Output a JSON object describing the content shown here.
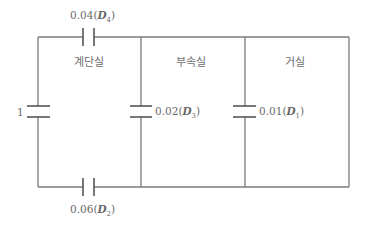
{
  "diagram": {
    "type": "equivalent-leakage-network",
    "rooms": [
      {
        "id": "stairwell",
        "label": "계단실"
      },
      {
        "id": "vestibule",
        "label": "부속실"
      },
      {
        "id": "living_room",
        "label": "거실"
      }
    ],
    "elements": [
      {
        "id": "source",
        "value": "1",
        "position": "left-vertical"
      },
      {
        "id": "D4",
        "value": "0.04",
        "symbol": "D",
        "subscript": "4",
        "position": "top-left-horizontal"
      },
      {
        "id": "D2",
        "value": "0.06",
        "symbol": "D",
        "subscript": "2",
        "position": "bottom-left-horizontal"
      },
      {
        "id": "D3",
        "value": "0.02",
        "symbol": "D",
        "subscript": "3",
        "position": "middle-vertical"
      },
      {
        "id": "D1",
        "value": "0.01",
        "symbol": "D",
        "subscript": "1",
        "position": "right-vertical"
      }
    ]
  },
  "labels": {
    "source_value": "1",
    "d4_value": "0.04",
    "d4_symbol": "D",
    "d4_sub": "4",
    "d2_value": "0.06",
    "d2_symbol": "D",
    "d2_sub": "2",
    "d3_value": "0.02",
    "d3_symbol": "D",
    "d3_sub": "3",
    "d1_value": "0.01",
    "d1_symbol": "D",
    "d1_sub": "1",
    "room_stairwell": "계단실",
    "room_vestibule": "부속실",
    "room_living": "거실"
  },
  "colors": {
    "wire": "#7a7a7a",
    "plate": "#555555",
    "text": "#6a6a6a",
    "background": "#ffffff"
  }
}
